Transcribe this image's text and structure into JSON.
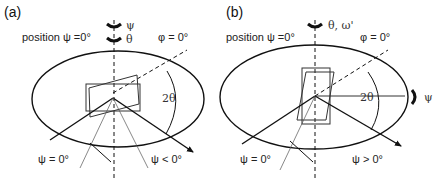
{
  "figure": {
    "panels": [
      {
        "id": "a",
        "label": "(a)",
        "position_text": "position ψ =0°",
        "rotation_labels": [
          "ψ",
          "θ"
        ],
        "phi_label": "φ = 0°",
        "angle_label": "2θ",
        "psi_zero_label": "ψ = 0°",
        "psi_tilt_label": "ψ < 0°"
      },
      {
        "id": "b",
        "label": "(b)",
        "position_text": "position ψ =0°",
        "rotation_labels": [
          "θ, ω'"
        ],
        "phi_label": "φ = 0°",
        "angle_label": "2θ",
        "side_rotation_label": "ψ",
        "psi_zero_label": "ψ = 0°",
        "psi_tilt_label": "ψ > 0°"
      }
    ]
  }
}
